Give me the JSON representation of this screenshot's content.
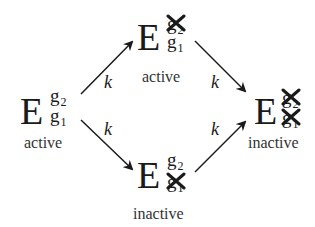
{
  "diagram": {
    "type": "state-transition",
    "colors": {
      "ink": "#1a1a1a",
      "label": "#333333",
      "background": "#ffffff"
    },
    "nodes": [
      {
        "id": "start",
        "symbol": "E",
        "upper": {
          "base": "g",
          "index": "2",
          "struck": false
        },
        "lower": {
          "base": "g",
          "index": "1",
          "struck": false
        },
        "label": "active"
      },
      {
        "id": "top",
        "symbol": "E",
        "upper": {
          "base": "g",
          "index": "2",
          "struck": true
        },
        "lower": {
          "base": "g",
          "index": "1",
          "struck": false
        },
        "label": "active"
      },
      {
        "id": "bottom",
        "symbol": "E",
        "upper": {
          "base": "g",
          "index": "2",
          "struck": false
        },
        "lower": {
          "base": "g",
          "index": "1",
          "struck": true
        },
        "label": "inactive"
      },
      {
        "id": "end",
        "symbol": "E",
        "upper": {
          "base": "g",
          "index": "2",
          "struck": true
        },
        "lower": {
          "base": "g",
          "index": "1",
          "struck": true
        },
        "label": "inactive"
      }
    ],
    "edges": [
      {
        "from": "start",
        "to": "top",
        "rate": "k"
      },
      {
        "from": "start",
        "to": "bottom",
        "rate": "k"
      },
      {
        "from": "top",
        "to": "end",
        "rate": "k"
      },
      {
        "from": "bottom",
        "to": "end",
        "rate": "k"
      }
    ]
  }
}
